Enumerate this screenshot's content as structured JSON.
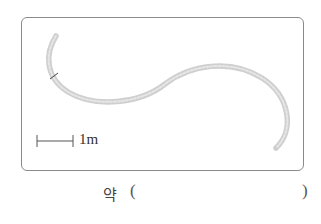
{
  "figure": {
    "rope_color": "#c8c8c8",
    "frame_color": "#8a8a8a",
    "scale_bar": {
      "label": "1m"
    }
  },
  "answer": {
    "prefix": "약",
    "open_paren": "(",
    "close_paren": ")",
    "value": ""
  }
}
